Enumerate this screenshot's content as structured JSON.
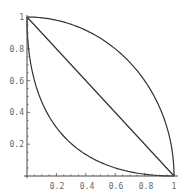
{
  "chart_data": {
    "type": "line",
    "title": "",
    "xlabel": "",
    "ylabel": "",
    "xlim": [
      0,
      1
    ],
    "ylim": [
      0,
      1
    ],
    "grid": false,
    "legend": null,
    "x_ticks": [
      "0.2",
      "0.4",
      "0.6",
      "0.8",
      "1"
    ],
    "y_ticks": [
      "0.2",
      "0.4",
      "0.6",
      "0.8",
      "1"
    ],
    "series": [
      {
        "name": "upper-concave",
        "description": "quarter circle x^2 + y^2 = 1",
        "x": [
          0,
          0.2,
          0.4,
          0.6,
          0.8,
          0.9,
          1
        ],
        "y": [
          1,
          0.98,
          0.917,
          0.8,
          0.6,
          0.436,
          0
        ]
      },
      {
        "name": "diagonal",
        "description": "x + y = 1",
        "x": [
          0,
          0.2,
          0.4,
          0.6,
          0.8,
          1
        ],
        "y": [
          1,
          0.8,
          0.6,
          0.4,
          0.2,
          0
        ]
      },
      {
        "name": "lower-convex",
        "description": "sqrt(x) + sqrt(y) = 1",
        "x": [
          0,
          0.05,
          0.2,
          0.4,
          0.6,
          0.8,
          1
        ],
        "y": [
          1,
          0.603,
          0.306,
          0.135,
          0.051,
          0.011,
          0
        ]
      }
    ]
  }
}
